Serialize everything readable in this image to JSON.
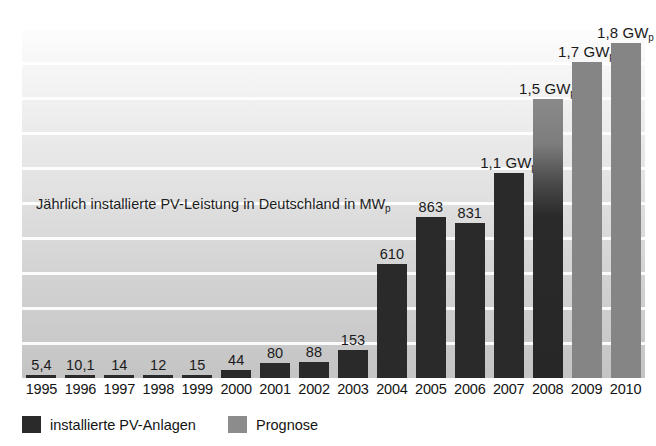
{
  "chart_data": {
    "type": "bar",
    "title": "Jährlich installierte PV-Leistung in Deutschland in MWp",
    "title_main": "Jährlich installierte PV-Leistung in Deutschland in MW",
    "title_sub": "p",
    "xlabel": "",
    "ylabel": "MWp",
    "ylim": [
      0,
      1880
    ],
    "grid": true,
    "gridline_count": 10,
    "legend_position": "bottom-left",
    "categories": [
      "1995",
      "1996",
      "1997",
      "1998",
      "1999",
      "2000",
      "2001",
      "2002",
      "2003",
      "2004",
      "2005",
      "2006",
      "2007",
      "2008",
      "2009",
      "2010"
    ],
    "values": [
      5.4,
      10.1,
      14,
      12,
      15,
      44,
      80,
      88,
      153,
      610,
      863,
      831,
      1100,
      1500,
      1700,
      1800
    ],
    "value_labels": [
      "5,4",
      "10,1",
      "14",
      "12",
      "15",
      "44",
      "80",
      "88",
      "153",
      "610",
      "863",
      "831",
      "1,1 GW",
      "1,5 GW",
      "1,7 GW",
      "1,8 GW"
    ],
    "value_label_subs": [
      "",
      "",
      "",
      "",
      "",
      "",
      "",
      "",
      "",
      "",
      "",
      "",
      "p",
      "p",
      "p",
      "p"
    ],
    "series_kinds": [
      "actual",
      "actual",
      "actual",
      "actual",
      "actual",
      "actual",
      "actual",
      "actual",
      "actual",
      "actual",
      "actual",
      "actual",
      "actual",
      "mixed",
      "forecast",
      "forecast"
    ],
    "series": [
      {
        "name": "installierte PV-Anlagen",
        "color": "#2a2a2a"
      },
      {
        "name": "Prognose",
        "color": "#8c8c8c"
      }
    ],
    "legend": [
      {
        "label": "installierte PV-Anlagen",
        "kind": "actual"
      },
      {
        "label": "Prognose",
        "kind": "forecast"
      }
    ]
  },
  "legend": {
    "item0": "installierte PV-Anlagen",
    "item1": "Prognose"
  },
  "axis": {
    "x0": "1995",
    "x1": "1996",
    "x2": "1997",
    "x3": "1998",
    "x4": "1999",
    "x5": "2000",
    "x6": "2001",
    "x7": "2002",
    "x8": "2003",
    "x9": "2004",
    "x10": "2005",
    "x11": "2006",
    "x12": "2007",
    "x13": "2008",
    "x14": "2009",
    "x15": "2010"
  },
  "labels": {
    "v0": "5,4",
    "v1": "10,1",
    "v2": "14",
    "v3": "12",
    "v4": "15",
    "v5": "44",
    "v6": "80",
    "v7": "88",
    "v8": "153",
    "v9": "610",
    "v10": "863",
    "v11": "831",
    "v12": "1,1 GW",
    "v13": "1,5 GW",
    "v14": "1,7 GW",
    "v15": "1,8 GW"
  },
  "title": {
    "main": "Jährlich installierte PV-Leistung in Deutschland in MW",
    "sub": "p"
  },
  "colors": {
    "actual": "#2a2a2a",
    "forecast": "#8c8c8c",
    "gridline": "#ffffff",
    "text": "#141414"
  }
}
